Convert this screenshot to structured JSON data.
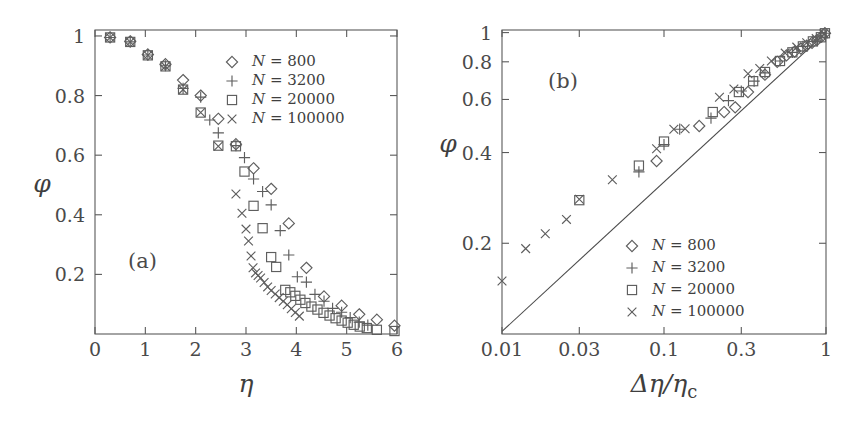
{
  "figure": {
    "background": "#ffffff",
    "ink_color": "#4a4a4a",
    "marker_color": "#5e5e5e"
  },
  "chart_data": [
    {
      "id": "panel-a",
      "type": "scatter",
      "panel_label": "(a)",
      "title": "",
      "xlabel": "η",
      "ylabel": "φ",
      "xscale": "linear",
      "yscale": "linear",
      "xlim": [
        0,
        6
      ],
      "ylim": [
        0,
        1.02
      ],
      "xticks": [
        0,
        1,
        2,
        3,
        4,
        5,
        6
      ],
      "xticklabels": [
        "0",
        "1",
        "2",
        "3",
        "4",
        "5",
        "6"
      ],
      "yticks": [
        0.2,
        0.4,
        0.6,
        0.8,
        1
      ],
      "yticklabels": [
        "0.2",
        "0.4",
        "0.6",
        "0.8",
        "1"
      ],
      "grid": false,
      "legend_position": "upper-center-right",
      "series": [
        {
          "name": "N = 800",
          "label_var": "N",
          "label_eq": "=",
          "label_val": "800",
          "marker": "diamond",
          "points": [
            [
              0.3,
              0.995
            ],
            [
              0.7,
              0.982
            ],
            [
              1.05,
              0.938
            ],
            [
              1.4,
              0.905
            ],
            [
              1.75,
              0.852
            ],
            [
              2.1,
              0.8
            ],
            [
              2.45,
              0.722
            ],
            [
              2.8,
              0.637
            ],
            [
              3.15,
              0.556
            ],
            [
              3.5,
              0.487
            ],
            [
              3.85,
              0.371
            ],
            [
              4.2,
              0.222
            ],
            [
              4.55,
              0.126
            ],
            [
              4.9,
              0.095
            ],
            [
              5.25,
              0.066
            ],
            [
              5.6,
              0.048
            ],
            [
              5.95,
              0.028
            ]
          ]
        },
        {
          "name": "N = 3200",
          "label_var": "N",
          "label_eq": "=",
          "label_val": "3200",
          "marker": "plus",
          "points": [
            [
              0.3,
              0.995
            ],
            [
              0.7,
              0.98
            ],
            [
              1.05,
              0.936
            ],
            [
              1.4,
              0.9
            ],
            [
              1.75,
              0.824
            ],
            [
              2.1,
              0.795
            ],
            [
              2.28,
              0.718
            ],
            [
              2.45,
              0.675
            ],
            [
              2.8,
              0.632
            ],
            [
              2.97,
              0.592
            ],
            [
              3.15,
              0.52
            ],
            [
              3.33,
              0.478
            ],
            [
              3.5,
              0.433
            ],
            [
              3.68,
              0.347
            ],
            [
              3.85,
              0.265
            ],
            [
              4.02,
              0.192
            ],
            [
              4.2,
              0.174
            ],
            [
              4.37,
              0.133
            ],
            [
              4.55,
              0.11
            ],
            [
              4.72,
              0.086
            ],
            [
              4.9,
              0.073
            ],
            [
              5.07,
              0.055
            ],
            [
              5.25,
              0.04
            ],
            [
              5.42,
              0.03
            ]
          ]
        },
        {
          "name": "N = 20000",
          "label_var": "N",
          "label_eq": "=",
          "label_val": "20000",
          "marker": "square",
          "points": [
            [
              0.3,
              0.995
            ],
            [
              0.7,
              0.98
            ],
            [
              1.05,
              0.935
            ],
            [
              1.4,
              0.898
            ],
            [
              1.75,
              0.82
            ],
            [
              2.1,
              0.743
            ],
            [
              2.45,
              0.632
            ],
            [
              2.8,
              0.63
            ],
            [
              2.97,
              0.545
            ],
            [
              3.15,
              0.43
            ],
            [
              3.33,
              0.355
            ],
            [
              3.5,
              0.258
            ],
            [
              3.6,
              0.225
            ],
            [
              3.78,
              0.148
            ],
            [
              3.88,
              0.14
            ],
            [
              3.98,
              0.128
            ],
            [
              4.08,
              0.115
            ],
            [
              4.18,
              0.104
            ],
            [
              4.3,
              0.092
            ],
            [
              4.42,
              0.082
            ],
            [
              4.54,
              0.071
            ],
            [
              4.66,
              0.062
            ],
            [
              4.78,
              0.053
            ],
            [
              4.9,
              0.045
            ],
            [
              5.02,
              0.038
            ],
            [
              5.14,
              0.031
            ],
            [
              5.26,
              0.025
            ],
            [
              5.4,
              0.02
            ],
            [
              5.6,
              0.014
            ],
            [
              5.95,
              0.01
            ]
          ]
        },
        {
          "name": "N = 100000",
          "label_var": "N",
          "label_eq": "=",
          "label_val": "100000",
          "marker": "cross",
          "points": [
            [
              0.3,
              0.995
            ],
            [
              0.7,
              0.98
            ],
            [
              1.05,
              0.935
            ],
            [
              1.4,
              0.898
            ],
            [
              1.75,
              0.82
            ],
            [
              2.1,
              0.743
            ],
            [
              2.45,
              0.63
            ],
            [
              2.8,
              0.47
            ],
            [
              2.92,
              0.405
            ],
            [
              3.0,
              0.352
            ],
            [
              3.05,
              0.312
            ],
            [
              3.1,
              0.262
            ],
            [
              3.14,
              0.222
            ],
            [
              3.19,
              0.205
            ],
            [
              3.24,
              0.196
            ],
            [
              3.29,
              0.188
            ],
            [
              3.36,
              0.173
            ],
            [
              3.43,
              0.158
            ],
            [
              3.5,
              0.146
            ],
            [
              3.58,
              0.134
            ],
            [
              3.66,
              0.122
            ],
            [
              3.74,
              0.11
            ],
            [
              3.82,
              0.098
            ],
            [
              3.9,
              0.085
            ],
            [
              3.98,
              0.072
            ],
            [
              4.06,
              0.06
            ]
          ]
        }
      ]
    },
    {
      "id": "panel-b",
      "type": "scatter",
      "panel_label": "(b)",
      "title": "",
      "xlabel": "Δη/η",
      "xlabel_sub": "c",
      "ylabel": "φ",
      "xscale": "log",
      "yscale": "log",
      "xlim": [
        0.01,
        1
      ],
      "ylim": [
        0.1,
        1.02
      ],
      "xticks": [
        0.01,
        0.03,
        0.1,
        0.3,
        1
      ],
      "xticklabels": [
        "0.01",
        "0.03",
        "0.1",
        "0.3",
        "1"
      ],
      "yticks": [
        0.2,
        0.4,
        0.6,
        0.8,
        1
      ],
      "yticklabels": [
        "0.2",
        "0.4",
        "0.6",
        "0.8",
        "1"
      ],
      "grid": false,
      "legend_position": "lower-right",
      "reference_line": {
        "name": "slope-one-guide",
        "from": [
          0.01,
          0.102
        ],
        "to": [
          1.0,
          1.0
        ]
      },
      "series": [
        {
          "name": "N = 800",
          "label_var": "N",
          "label_eq": "=",
          "label_val": "800",
          "marker": "diamond",
          "points": [
            [
              0.09,
              0.375
            ],
            [
              0.165,
              0.49
            ],
            [
              0.235,
              0.545
            ],
            [
              0.275,
              0.565
            ],
            [
              0.33,
              0.635
            ],
            [
              0.42,
              0.725
            ],
            [
              0.5,
              0.8
            ],
            [
              0.57,
              0.84
            ],
            [
              0.64,
              0.865
            ],
            [
              0.7,
              0.885
            ],
            [
              0.76,
              0.905
            ],
            [
              0.82,
              0.925
            ],
            [
              0.88,
              0.945
            ],
            [
              0.94,
              0.97
            ],
            [
              0.985,
              0.995
            ]
          ]
        },
        {
          "name": "N = 3200",
          "label_var": "N",
          "label_eq": "=",
          "label_val": "3200",
          "marker": "plus",
          "points": [
            [
              0.07,
              0.345
            ],
            [
              0.1,
              0.425
            ],
            [
              0.125,
              0.478
            ],
            [
              0.195,
              0.52
            ],
            [
              0.25,
              0.595
            ],
            [
              0.3,
              0.64
            ],
            [
              0.36,
              0.69
            ],
            [
              0.42,
              0.735
            ],
            [
              0.52,
              0.805
            ],
            [
              0.62,
              0.86
            ],
            [
              0.72,
              0.9
            ],
            [
              0.83,
              0.935
            ],
            [
              0.93,
              0.965
            ],
            [
              0.985,
              0.995
            ]
          ]
        },
        {
          "name": "N = 20000",
          "label_var": "N",
          "label_eq": "=",
          "label_val": "20000",
          "marker": "square",
          "points": [
            [
              0.03,
              0.278
            ],
            [
              0.07,
              0.362
            ],
            [
              0.1,
              0.435
            ],
            [
              0.2,
              0.545
            ],
            [
              0.29,
              0.635
            ],
            [
              0.355,
              0.69
            ],
            [
              0.42,
              0.74
            ],
            [
              0.52,
              0.805
            ],
            [
              0.62,
              0.86
            ],
            [
              0.72,
              0.9
            ],
            [
              0.83,
              0.935
            ],
            [
              0.93,
              0.965
            ],
            [
              0.985,
              0.995
            ]
          ]
        },
        {
          "name": "N = 100000",
          "label_var": "N",
          "label_eq": "=",
          "label_val": "100000",
          "marker": "cross",
          "points": [
            [
              0.01,
              0.15
            ],
            [
              0.014,
              0.192
            ],
            [
              0.0185,
              0.215
            ],
            [
              0.025,
              0.24
            ],
            [
              0.03,
              0.28
            ],
            [
              0.048,
              0.325
            ],
            [
              0.09,
              0.412
            ],
            [
              0.115,
              0.478
            ],
            [
              0.135,
              0.48
            ],
            [
              0.22,
              0.61
            ],
            [
              0.27,
              0.65
            ],
            [
              0.33,
              0.73
            ],
            [
              0.39,
              0.76
            ],
            [
              0.46,
              0.805
            ],
            [
              0.56,
              0.855
            ],
            [
              0.66,
              0.895
            ],
            [
              0.76,
              0.925
            ],
            [
              0.87,
              0.955
            ],
            [
              0.97,
              0.99
            ]
          ]
        }
      ]
    }
  ]
}
